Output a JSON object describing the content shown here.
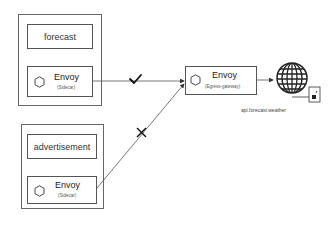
{
  "diagram": {
    "pods": [
      {
        "service": {
          "label": "forecast"
        },
        "envoy": {
          "label": "Envoy",
          "sub": "(Sidecar)"
        }
      },
      {
        "service": {
          "label": "advertisement"
        },
        "envoy": {
          "label": "Envoy",
          "sub": "(Sidecar)"
        }
      }
    ],
    "egress": {
      "label": "Envoy",
      "sub": "(Egress-gateway)"
    },
    "external": {
      "host": "api.forecast.weather"
    },
    "connections": [
      {
        "from": "forecast-envoy",
        "to": "egress",
        "status": "allowed",
        "marker": "check"
      },
      {
        "from": "advertisement-envoy",
        "to": "egress",
        "status": "blocked",
        "marker": "cross"
      },
      {
        "from": "egress",
        "to": "external",
        "status": "allowed",
        "marker": ""
      }
    ],
    "colors": {
      "line": "#555555",
      "border": "#555555",
      "marker": "#111111"
    }
  }
}
